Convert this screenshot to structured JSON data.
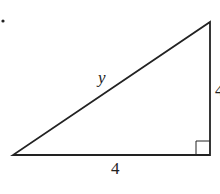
{
  "diagram": {
    "type": "right-triangle",
    "bullet": "•",
    "labels": {
      "hypotenuse": "y",
      "base": "4",
      "height": "4"
    },
    "right_angle_marker": "bottom-right",
    "stroke_color": "#222222"
  }
}
